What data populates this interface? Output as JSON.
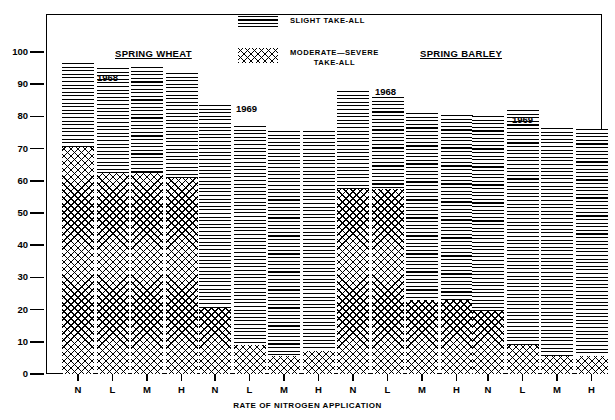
{
  "chart_data": {
    "type": "bar",
    "title": "",
    "xlabel": "RATE OF NITROGEN APPLICATION",
    "ylabel": "% PLANTS INFECTED",
    "ylim": [
      0,
      105
    ],
    "yticks": [
      0,
      10,
      20,
      30,
      40,
      50,
      60,
      70,
      80,
      90,
      100
    ],
    "ytick_labels": [
      "0",
      "10",
      "20",
      "30",
      "40",
      "50",
      "60",
      "70",
      "80",
      "90",
      "100"
    ],
    "grid": false,
    "stacked": true,
    "categories": [
      "N",
      "L",
      "M",
      "H"
    ],
    "legend": {
      "position": "top-center",
      "entries": [
        {
          "name": "SLIGHT TAKE-ALL",
          "pattern": "horizontal-lines"
        },
        {
          "name": "MODERATE—SEVERE\nTAKE-ALL",
          "pattern": "cross-hatch"
        }
      ]
    },
    "group_titles": [
      {
        "label": "SPRING WHEAT",
        "underline": true
      },
      {
        "label": "SPRING BARLEY",
        "underline": true
      }
    ],
    "groups": [
      {
        "crop": "SPRING WHEAT",
        "year": "1968",
        "categories": [
          "N",
          "L",
          "M",
          "H"
        ],
        "series": [
          {
            "name": "MODERATE—SEVERE TAKE-ALL",
            "values": [
              70.5,
              62.5,
              62.5,
              61.0
            ]
          },
          {
            "name": "SLIGHT TAKE-ALL",
            "values": [
              26.0,
              32.5,
              33.0,
              32.5
            ]
          }
        ],
        "totals": [
          96.5,
          95.0,
          95.5,
          93.5
        ]
      },
      {
        "crop": "SPRING WHEAT",
        "year": "1969",
        "categories": [
          "N",
          "L",
          "M",
          "H"
        ],
        "series": [
          {
            "name": "MODERATE—SEVERE TAKE-ALL",
            "values": [
              20.5,
              9.0,
              5.5,
              7.0
            ]
          },
          {
            "name": "SLIGHT TAKE-ALL",
            "values": [
              63.0,
              68.0,
              70.0,
              68.5
            ]
          }
        ],
        "totals": [
          83.5,
          77.0,
          75.5,
          75.5
        ]
      },
      {
        "crop": "SPRING BARLEY",
        "year": "1968",
        "categories": [
          "N",
          "L",
          "M",
          "H"
        ],
        "series": [
          {
            "name": "MODERATE—SEVERE TAKE-ALL",
            "values": [
              57.5,
              57.5,
              23.0,
              23.0
            ]
          },
          {
            "name": "SLIGHT TAKE-ALL",
            "values": [
              30.5,
              28.5,
              58.0,
              57.5
            ]
          }
        ],
        "totals": [
          88.0,
          86.0,
          81.0,
          80.5
        ]
      },
      {
        "crop": "SPRING BARLEY",
        "year": "1969",
        "categories": [
          "N",
          "L",
          "M",
          "H"
        ],
        "series": [
          {
            "name": "MODERATE—SEVERE TAKE-ALL",
            "values": [
              19.5,
              9.0,
              5.5,
              5.5
            ]
          },
          {
            "name": "SLIGHT TAKE-ALL",
            "values": [
              60.5,
              73.0,
              71.0,
              70.5
            ]
          }
        ],
        "totals": [
          80.0,
          82.0,
          76.5,
          76.0
        ]
      }
    ]
  }
}
